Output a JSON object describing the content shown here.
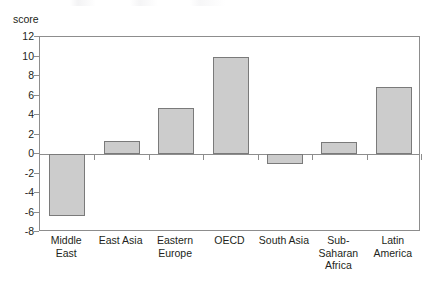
{
  "chart_data": {
    "type": "bar",
    "title": "",
    "subtitle": "",
    "xlabel": "",
    "ylabel": "score",
    "ylim": [
      -8,
      12
    ],
    "ytick_values": [
      12,
      10,
      8,
      6,
      4,
      2,
      0,
      -2,
      -4,
      -6,
      -8
    ],
    "ytick_labels": [
      "12",
      "10",
      "8",
      "6",
      "4",
      "2",
      "0",
      "-2",
      "-4",
      "-6",
      "-8"
    ],
    "grid": false,
    "legend": null,
    "categories": [
      "Middle East",
      "East Asia",
      "Eastern Europe",
      "OECD",
      "South Asia",
      "Sub-Saharan Africa",
      "Latin America"
    ],
    "category_lines": [
      [
        "Middle East"
      ],
      [
        "East Asia"
      ],
      [
        "Eastern",
        "Europe"
      ],
      [
        "OECD"
      ],
      [
        "South Asia"
      ],
      [
        "Sub-Saharan",
        "Africa"
      ],
      [
        "Latin",
        "America"
      ]
    ],
    "values": [
      -6.4,
      1.3,
      4.7,
      10.0,
      -1.0,
      1.2,
      6.9
    ],
    "series": [
      {
        "name": "score",
        "values": [
          -6.4,
          1.3,
          4.7,
          10.0,
          -1.0,
          1.2,
          6.9
        ]
      }
    ],
    "bar_fill": "#cccccc",
    "bar_stroke": "#7a7a7a",
    "axis_color": "#8d8d8d",
    "text_color": "#231f20",
    "background": "#ffffff"
  }
}
